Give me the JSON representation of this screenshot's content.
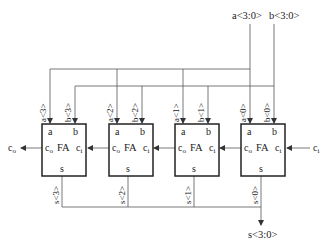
{
  "diagram": {
    "bus_inputs": {
      "a": "a<3:0>",
      "b": "b<3:0>"
    },
    "bus_output": "s<3:0>",
    "carry_in_label": "c",
    "carry_in_sub": "i",
    "carry_out_label": "c",
    "carry_out_sub": "o",
    "adders": [
      {
        "index": 3,
        "name": "FA",
        "a_in": "a<3>",
        "b_in": "b<3>",
        "s_out": "s<3>",
        "port_a": "a",
        "port_b": "b",
        "port_co": "c",
        "port_co_sub": "o",
        "port_ci": "c",
        "port_ci_sub": "i",
        "port_s": "s"
      },
      {
        "index": 2,
        "name": "FA",
        "a_in": "a<2>",
        "b_in": "b<2>",
        "s_out": "s<2>",
        "port_a": "a",
        "port_b": "b",
        "port_co": "c",
        "port_co_sub": "o",
        "port_ci": "c",
        "port_ci_sub": "i",
        "port_s": "s"
      },
      {
        "index": 1,
        "name": "FA",
        "a_in": "a<1>",
        "b_in": "b<1>",
        "s_out": "s<1>",
        "port_a": "a",
        "port_b": "b",
        "port_co": "c",
        "port_co_sub": "o",
        "port_ci": "c",
        "port_ci_sub": "i",
        "port_s": "s"
      },
      {
        "index": 0,
        "name": "FA",
        "a_in": "a<0>",
        "b_in": "b<0>",
        "s_out": "s<0>",
        "port_a": "a",
        "port_b": "b",
        "port_co": "c",
        "port_co_sub": "o",
        "port_ci": "c",
        "port_ci_sub": "i",
        "port_s": "s"
      }
    ],
    "colors": {
      "line": "#555555",
      "box": "#222222",
      "text": "#222222"
    }
  }
}
